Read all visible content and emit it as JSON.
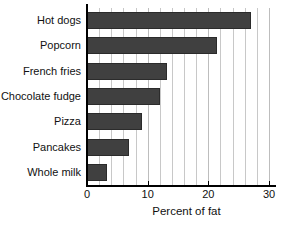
{
  "chart_data": {
    "type": "bar",
    "orientation": "horizontal",
    "title": "",
    "xlabel": "Percent of fat",
    "ylabel": "",
    "categories": [
      "Hot dogs",
      "Popcorn",
      "French fries",
      "Chocolate fudge",
      "Pizza",
      "Pancakes",
      "Whole milk"
    ],
    "values": [
      27,
      21.5,
      13.2,
      12,
      9,
      7,
      3.3
    ],
    "xlim": [
      0,
      30
    ],
    "xticks": [
      0,
      10,
      20,
      30
    ],
    "xtick_labels": [
      "0",
      "10",
      "20",
      "30"
    ],
    "minor_gridline_step": 2,
    "grid": "vertical-only",
    "legend": null,
    "bar_color": "#404040",
    "gridline_color": "#c8c8c8",
    "axis_color": "#000000",
    "background_color": "#ffffff"
  },
  "axes": {
    "x_title": "Percent of fat"
  }
}
